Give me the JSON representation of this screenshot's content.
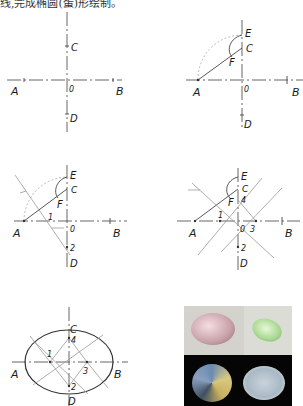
{
  "caption": "线,完成椭圆(蛋)形绘制。",
  "panels": [
    {
      "step": 1,
      "labels": {
        "A": "A",
        "B": "B",
        "C": "C",
        "D": "D",
        "O": "0"
      }
    },
    {
      "step": 2,
      "labels": {
        "A": "A",
        "B": "B",
        "C": "C",
        "D": "D",
        "O": "0",
        "E": "E",
        "F": "F"
      }
    },
    {
      "step": 3,
      "labels": {
        "A": "A",
        "B": "B",
        "C": "C",
        "D": "D",
        "O": "0",
        "E": "E",
        "F": "F",
        "p1": "1",
        "p2": "2"
      }
    },
    {
      "step": 4,
      "labels": {
        "A": "A",
        "B": "B",
        "C": "C",
        "D": "D",
        "O": "0",
        "E": "E",
        "F": "F",
        "p1": "1",
        "p2": "2",
        "p3": "3",
        "p4": "4"
      }
    },
    {
      "step": 5,
      "labels": {
        "A": "A",
        "B": "B",
        "C": "C",
        "D": "D",
        "p1": "1",
        "p2": "2",
        "p3": "3",
        "p4": "4"
      }
    }
  ],
  "photo": {
    "gems": [
      "pink-oval-gem",
      "green-oval-gem",
      "multicolor-oval-gem",
      "clear-oval-gem"
    ]
  }
}
